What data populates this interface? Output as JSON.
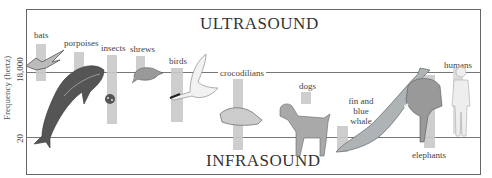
{
  "diagram": {
    "title_top": "ULTRASOUND",
    "title_bottom": "INFRASOUND",
    "y_axis_label": "Frequency (hertz)",
    "y_ticks": [
      "18,000",
      "20"
    ]
  },
  "animals": [
    {
      "label": "bats",
      "icon": "bat-icon"
    },
    {
      "label": "porpoises",
      "icon": "porpoise-icon"
    },
    {
      "label": "insects",
      "icon": "ladybug-icon"
    },
    {
      "label": "shrews",
      "icon": "shrew-icon"
    },
    {
      "label": "birds",
      "icon": "bird-icon"
    },
    {
      "label": "crocodilians",
      "icon": "crocodile-icon"
    },
    {
      "label": "dogs",
      "icon": "dog-icon"
    },
    {
      "label": "fin and",
      "label2": "blue",
      "label3": "whale",
      "icon": "whale-icon"
    },
    {
      "label": "elephants",
      "icon": "elephant-icon"
    },
    {
      "label": "humans",
      "icon": "human-icon"
    }
  ],
  "colors": {
    "bar": "#c9c9c9",
    "frame": "#666666",
    "text": "#3a3a3a"
  }
}
